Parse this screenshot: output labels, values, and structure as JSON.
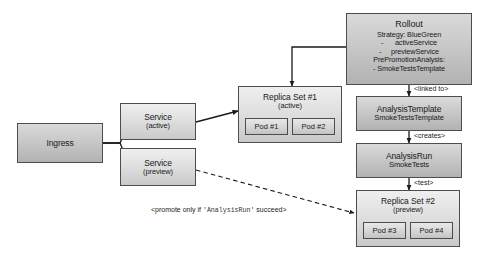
{
  "diagram": {
    "colors": {
      "node_fill_light": "#dcdcdc",
      "node_fill_dark": "#c4c4c4",
      "node_stroke": "#4d4d4d",
      "edge_stroke": "#1a1a1a",
      "background": "#ffffff",
      "text": "#1a1a1a"
    },
    "nodes": {
      "ingress": {
        "title": "Ingress"
      },
      "service_active": {
        "title": "Service",
        "sub": "(active)"
      },
      "service_preview": {
        "title": "Service",
        "sub": "(preview)"
      },
      "replica_set_1": {
        "title": "Replica Set #1",
        "sub": "(active)",
        "pods": [
          "Pod #1",
          "Pod #2"
        ]
      },
      "replica_set_2": {
        "title": "Replica Set #2",
        "sub": "(preview)",
        "pods": [
          "Pod #3",
          "Pod #4"
        ]
      },
      "rollout": {
        "title": "Rollout",
        "spec": [
          "Strategy: BlueGreen",
          "-      activeService",
          "-     previewService",
          "PrePromotionAnalysis:",
          "- SmokeTestsTemplate"
        ]
      },
      "analysis_template": {
        "title": "AnalysisTemplate",
        "sub": "SmokeTestsTemplate"
      },
      "analysis_run": {
        "title": "AnalysisRun",
        "sub": "SmokeTests"
      }
    },
    "edge_labels": {
      "linked_to": "<linked to>",
      "creates": "<creates>",
      "test": "<test>"
    },
    "promote_note": {
      "prefix": "<promote only if ",
      "ref": "'AnalysisRun'",
      "suffix": " succeed>"
    }
  }
}
